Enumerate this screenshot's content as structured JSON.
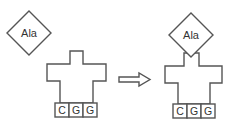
{
  "diagram": {
    "left": {
      "amino_acid": "Ala",
      "anticodon": [
        "C",
        "G",
        "G"
      ],
      "state": "unbound"
    },
    "arrow": "right-arrow",
    "right": {
      "amino_acid": "Ala",
      "anticodon": [
        "C",
        "G",
        "G"
      ],
      "state": "bound"
    }
  }
}
